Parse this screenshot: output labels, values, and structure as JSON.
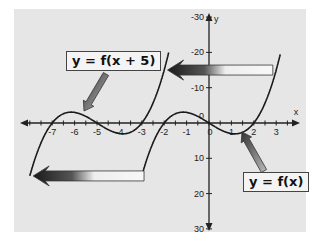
{
  "chart_data": {
    "type": "line",
    "title": "",
    "xlabel": "x",
    "ylabel": "y",
    "xlim": [
      -8,
      4
    ],
    "ylim": [
      -30,
      30
    ],
    "x_ticks": [
      -7,
      -6,
      -5,
      -4,
      -3,
      -2,
      -1,
      0,
      1,
      2,
      3
    ],
    "y_ticks": [
      -30,
      -20,
      -10,
      10,
      20,
      30
    ],
    "grid": false,
    "series": [
      {
        "name": "y = f(x)",
        "function": "x^3 - 4x",
        "zeros": [
          -2,
          0,
          2
        ]
      },
      {
        "name": "y = f(x + 5)",
        "function": "(x+5)^3 - 4(x+5)",
        "zeros": [
          -7,
          -5,
          -3
        ]
      }
    ],
    "annotations": [
      {
        "type": "arrow",
        "direction": "left",
        "meaning": "shift left 5 units",
        "y": 15
      },
      {
        "type": "arrow",
        "direction": "left",
        "meaning": "shift left 5 units",
        "y": -15
      }
    ]
  },
  "axes": {
    "x_label": "x",
    "y_label": "y",
    "x_tick_labels": [
      "-7",
      "-6",
      "-5",
      "-4",
      "-3",
      "-2",
      "-1",
      "0",
      "1",
      "2",
      "3"
    ],
    "y_tick_labels": [
      "30",
      "20",
      "10",
      "-10",
      "-20",
      "-30"
    ],
    "origin_label": "0"
  },
  "labels": {
    "shifted": "y = f(x + 5)",
    "original": "y = f(x)"
  }
}
